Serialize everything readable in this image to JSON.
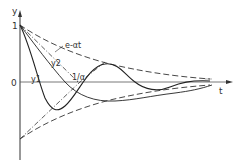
{
  "diagram": {
    "axes": {
      "y_label": "y",
      "x_label": "t",
      "origin_label": "0",
      "y_tick_label": "1"
    },
    "curves": [
      {
        "name": "envelope",
        "label": "e-αt",
        "style": "dashed"
      },
      {
        "name": "y1",
        "label": "y1",
        "style": "solid"
      },
      {
        "name": "y2",
        "label": "y2",
        "style": "solid"
      },
      {
        "name": "tangent",
        "label": "1/α",
        "style": "dash-dot"
      }
    ],
    "colors": {
      "line": "#333333",
      "background": "#ffffff"
    }
  }
}
